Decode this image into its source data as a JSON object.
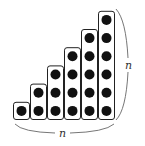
{
  "diagram": {
    "columns": [
      1,
      2,
      3,
      4,
      5,
      6
    ],
    "bottom_label": "n",
    "side_label": "n",
    "colors": {
      "dot": "#111111",
      "column_border": "#222222",
      "column_fill": "#ffffff",
      "brace": "#555555",
      "label": "#333333"
    }
  }
}
